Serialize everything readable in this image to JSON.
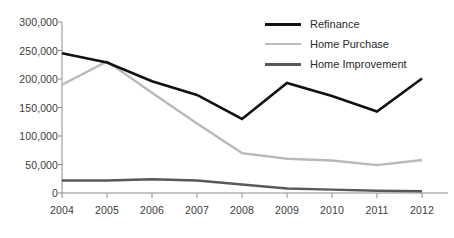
{
  "chart_data": {
    "type": "line",
    "title": "",
    "xlabel": "",
    "ylabel": "",
    "categories": [
      "2004",
      "2005",
      "2006",
      "2007",
      "2008",
      "2009",
      "2010",
      "2011",
      "2012"
    ],
    "x": [
      2004,
      2005,
      2006,
      2007,
      2008,
      2009,
      2010,
      2011,
      2012
    ],
    "ylim": [
      0,
      300000
    ],
    "xlim": [
      2004,
      2012
    ],
    "grid": false,
    "legend_position": "top-right",
    "ytick_labels": [
      "300,000",
      "250,000",
      "200,000",
      "150,000",
      "100,000",
      "50,000",
      "0"
    ],
    "ytick_values": [
      300000,
      250000,
      200000,
      150000,
      100000,
      50000,
      0
    ],
    "series": [
      {
        "name": "Refinance",
        "color": "#111111",
        "width": 2.6,
        "values": [
          245000,
          229000,
          196000,
          172000,
          130000,
          193000,
          170000,
          143000,
          201000
        ]
      },
      {
        "name": "Home Purchase",
        "color": "#b9b9b9",
        "width": 2.4,
        "values": [
          190000,
          231000,
          176000,
          122000,
          70000,
          60000,
          57000,
          49000,
          58000
        ]
      },
      {
        "name": "Home Improvement",
        "color": "#59595b",
        "width": 2.4,
        "values": [
          22000,
          22000,
          24000,
          22000,
          15000,
          8000,
          6000,
          4000,
          3000
        ]
      }
    ]
  },
  "legend": {
    "items": [
      {
        "label": "Refinance",
        "color": "#111111",
        "thickness": 3.4
      },
      {
        "label": "Home Purchase",
        "color": "#bcbcbc",
        "thickness": 2.6
      },
      {
        "label": "Home Improvement",
        "color": "#58585a",
        "thickness": 3.0
      }
    ]
  },
  "axis": {
    "line_color": "#8d8d8d"
  }
}
